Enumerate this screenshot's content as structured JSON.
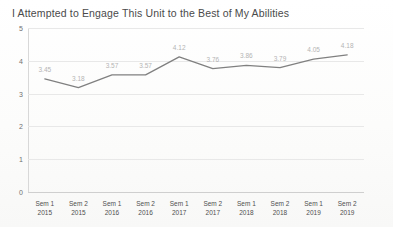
{
  "chart_data": {
    "type": "line",
    "title": "I Attempted to Engage This Unit to the Best of My Abilities",
    "xlabel": "",
    "ylabel": "",
    "ylim": [
      0,
      5
    ],
    "yticks": [
      "0",
      "1",
      "2",
      "3",
      "4",
      "5"
    ],
    "grid": true,
    "legend": "none",
    "line_color": "#808080",
    "label_color": "#b4b4b4",
    "categories": [
      {
        "term": "Sem 1",
        "year": "2015"
      },
      {
        "term": "Sem 2",
        "year": "2015"
      },
      {
        "term": "Sem 1",
        "year": "2016"
      },
      {
        "term": "Sem 2",
        "year": "2016"
      },
      {
        "term": "Sem 1",
        "year": "2017"
      },
      {
        "term": "Sem 2",
        "year": "2017"
      },
      {
        "term": "Sem 1",
        "year": "2018"
      },
      {
        "term": "Sem 2",
        "year": "2018"
      },
      {
        "term": "Sem 1",
        "year": "2019"
      },
      {
        "term": "Sem 2",
        "year": "2019"
      }
    ],
    "values": [
      3.45,
      3.18,
      3.57,
      3.57,
      4.12,
      3.76,
      3.86,
      3.79,
      4.05,
      4.18
    ],
    "data_labels": [
      "3.45",
      "3.18",
      "3.57",
      "3.57",
      "4.12",
      "3.76",
      "3.86",
      "3.79",
      "4.05",
      "4.18"
    ]
  }
}
